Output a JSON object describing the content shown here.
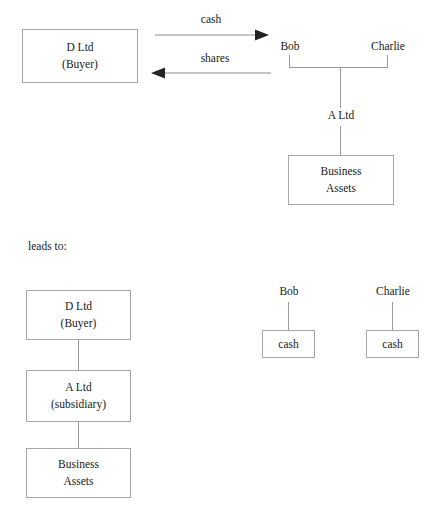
{
  "diagram": {
    "colors": {
      "box_border": "#a8a8a8",
      "line": "#9a9a9a",
      "arrow": "#2b2b2b",
      "text": "#1a1a1a",
      "background": "#ffffff"
    },
    "connector_label": "leads to:",
    "top_section": {
      "buyer_box": {
        "line1": "D Ltd",
        "line2": "(Buyer)"
      },
      "arrows": [
        {
          "label": "cash",
          "direction": "right"
        },
        {
          "label": "shares",
          "direction": "left"
        }
      ],
      "shareholders": [
        {
          "name": "Bob"
        },
        {
          "name": "Charlie"
        }
      ],
      "company": "A Ltd",
      "assets_box": {
        "line1": "Business",
        "line2": "Assets"
      }
    },
    "bottom_section": {
      "chain": [
        {
          "line1": "D Ltd",
          "line2": "(Buyer)"
        },
        {
          "line1": "A Ltd",
          "line2": "(subsidiary)"
        },
        {
          "line1": "Business",
          "line2": "Assets"
        }
      ],
      "shareholders": [
        {
          "name": "Bob",
          "box_label": "cash"
        },
        {
          "name": "Charlie",
          "box_label": "cash"
        }
      ]
    }
  }
}
